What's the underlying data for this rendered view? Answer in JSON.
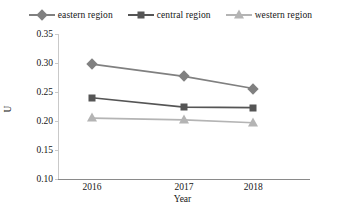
{
  "chart_data": {
    "type": "line",
    "title": "",
    "xlabel": "Year",
    "ylabel": "U",
    "categories": [
      "2016",
      "2017",
      "2018"
    ],
    "x": [
      2016,
      2017,
      2018
    ],
    "ylim": [
      0.1,
      0.35
    ],
    "yticks": [
      "0.10",
      "0.15",
      "0.20",
      "0.25",
      "0.30",
      "0.35"
    ],
    "ytick_values": [
      0.1,
      0.15,
      0.2,
      0.25,
      0.3,
      0.35
    ],
    "grid": false,
    "legend_position": "top-center",
    "series": [
      {
        "name": "eastern region",
        "marker": "diamond",
        "color": "#808080",
        "values": [
          0.298,
          0.277,
          0.256
        ]
      },
      {
        "name": "central region",
        "marker": "square",
        "color": "#555555",
        "values": [
          0.24,
          0.224,
          0.223
        ]
      },
      {
        "name": "western region",
        "marker": "triangle",
        "color": "#b4b4b4",
        "values": [
          0.205,
          0.202,
          0.197
        ]
      }
    ]
  },
  "legend": {
    "items": [
      {
        "label": "eastern region",
        "marker": "diamond",
        "color": "#808080"
      },
      {
        "label": "central region",
        "marker": "square",
        "color": "#555555"
      },
      {
        "label": "western region",
        "marker": "triangle",
        "color": "#b4b4b4"
      }
    ]
  },
  "axes": {
    "ylabel": "U",
    "xlabel": "Year",
    "ytick_labels": [
      "0.35",
      "0.30",
      "0.25",
      "0.20",
      "0.15",
      "0.10"
    ],
    "xtick_labels": [
      "2016",
      "2017",
      "2018"
    ]
  }
}
